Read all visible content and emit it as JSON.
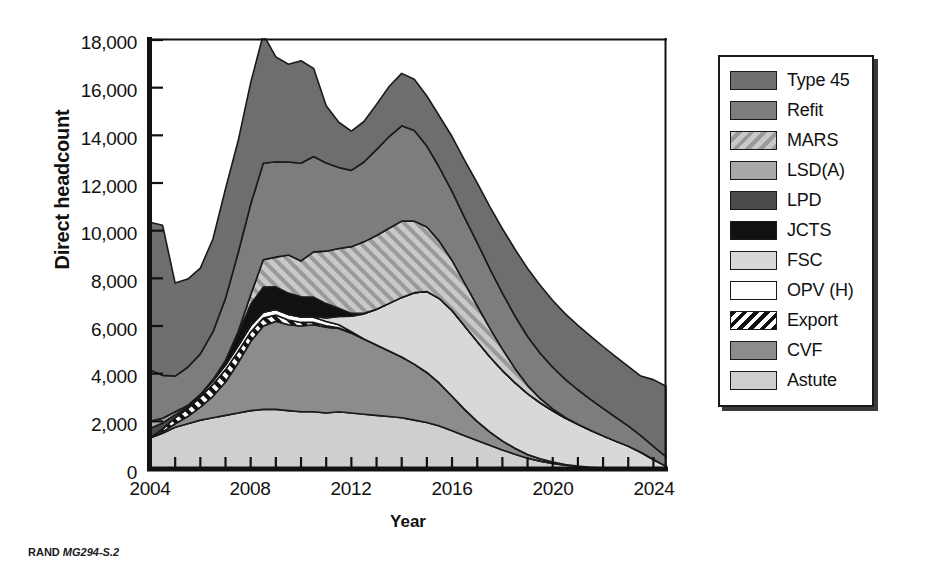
{
  "figure": {
    "caption_prefix": "RAND",
    "caption_code": "MG294-S.2"
  },
  "axes": {
    "y_title": "Direct headcount",
    "x_title": "Year",
    "y_ticks": [
      "0",
      "2,000",
      "4,000",
      "6,000",
      "8,000",
      "10,000",
      "12,000",
      "14,000",
      "16,000",
      "18,000"
    ],
    "x_ticks": [
      "2004",
      "2008",
      "2012",
      "2016",
      "2020",
      "2024"
    ]
  },
  "legend": {
    "items": [
      {
        "label": "Type 45",
        "fill": "#6e6e6e",
        "pattern": "solid"
      },
      {
        "label": "Refit",
        "fill": "#7d7d7d",
        "pattern": "solid"
      },
      {
        "label": "MARS",
        "fill": "#b4b4b4",
        "pattern": "hatch-grey"
      },
      {
        "label": "LSD(A)",
        "fill": "#a8a8a8",
        "pattern": "solid"
      },
      {
        "label": "LPD",
        "fill": "#4a4a4a",
        "pattern": "solid"
      },
      {
        "label": "JCTS",
        "fill": "#111111",
        "pattern": "solid"
      },
      {
        "label": "FSC",
        "fill": "#d8d8d8",
        "pattern": "solid"
      },
      {
        "label": "OPV (H)",
        "fill": "#ffffff",
        "pattern": "solid"
      },
      {
        "label": "Export",
        "fill": "#ffffff",
        "pattern": "hatch-black"
      },
      {
        "label": "CVF",
        "fill": "#8c8c8c",
        "pattern": "solid"
      },
      {
        "label": "Astute",
        "fill": "#cfcfcf",
        "pattern": "solid"
      }
    ]
  },
  "chart_data": {
    "type": "area",
    "stacked": true,
    "title": "",
    "xlabel": "Year",
    "ylabel": "Direct headcount",
    "xlim": [
      2004,
      2024.5
    ],
    "ylim": [
      0,
      18000
    ],
    "ytick_interval": 2000,
    "grid": false,
    "legend_position": "right-outside",
    "note": "Stacked area chart of UK naval shipbuilding direct headcount by programme, 2004-2024. Series are stacked bottom-to-top in the order listed below (Astute at the bottom, Type 45 at the top).",
    "x": [
      2004,
      2004.5,
      2005,
      2005.5,
      2006,
      2006.5,
      2007,
      2007.5,
      2008,
      2008.5,
      2009,
      2009.5,
      2010,
      2010.5,
      2011,
      2011.5,
      2012,
      2012.5,
      2013,
      2013.5,
      2014,
      2014.5,
      2015,
      2015.5,
      2016,
      2016.5,
      2017,
      2017.5,
      2018,
      2018.5,
      2019,
      2019.5,
      2020,
      2020.5,
      2021,
      2021.5,
      2022,
      2022.5,
      2023,
      2023.5,
      2024,
      2024.5
    ],
    "series": [
      {
        "name": "Astute",
        "fill": "#cfcfcf",
        "pattern": "solid",
        "values": [
          1300,
          1500,
          1750,
          1900,
          2050,
          2150,
          2250,
          2350,
          2450,
          2500,
          2500,
          2450,
          2400,
          2400,
          2350,
          2400,
          2350,
          2300,
          2250,
          2200,
          2150,
          2050,
          1950,
          1800,
          1600,
          1400,
          1200,
          1000,
          800,
          620,
          450,
          330,
          230,
          160,
          110,
          70,
          40,
          20,
          10,
          0,
          0,
          0
        ]
      },
      {
        "name": "CVF",
        "fill": "#8c8c8c",
        "pattern": "solid",
        "values": [
          0,
          60,
          150,
          300,
          550,
          900,
          1400,
          2100,
          2900,
          3500,
          3700,
          3600,
          3600,
          3650,
          3600,
          3500,
          3350,
          3150,
          2950,
          2750,
          2550,
          2350,
          2100,
          1800,
          1450,
          1100,
          800,
          560,
          380,
          250,
          160,
          100,
          60,
          30,
          15,
          5,
          0,
          0,
          0,
          0,
          0,
          0
        ]
      },
      {
        "name": "Export",
        "fill": "#ffffff",
        "pattern": "hatch-black",
        "values": [
          0,
          120,
          260,
          330,
          420,
          500,
          520,
          480,
          400,
          330,
          260,
          200,
          150,
          100,
          60,
          30,
          10,
          0,
          0,
          0,
          0,
          0,
          0,
          0,
          0,
          0,
          0,
          0,
          0,
          0,
          0,
          0,
          0,
          0,
          0,
          0,
          0,
          0,
          0,
          0,
          0,
          0
        ]
      },
      {
        "name": "OPV (H)",
        "fill": "#ffffff",
        "pattern": "solid",
        "values": [
          0,
          0,
          0,
          40,
          90,
          140,
          190,
          230,
          260,
          250,
          230,
          230,
          230,
          220,
          180,
          120,
          50,
          10,
          0,
          0,
          0,
          0,
          0,
          0,
          0,
          0,
          0,
          0,
          0,
          0,
          0,
          0,
          0,
          0,
          0,
          0,
          0,
          0,
          0,
          0,
          0,
          0
        ]
      },
      {
        "name": "FSC",
        "fill": "#d8d8d8",
        "pattern": "solid",
        "values": [
          0,
          0,
          0,
          0,
          0,
          0,
          0,
          0,
          0,
          0,
          0,
          0,
          0,
          40,
          150,
          350,
          650,
          1050,
          1500,
          2000,
          2500,
          3000,
          3400,
          3550,
          3600,
          3500,
          3350,
          3150,
          2950,
          2750,
          2550,
          2350,
          2150,
          1950,
          1750,
          1550,
          1350,
          1150,
          950,
          700,
          400,
          120
        ]
      },
      {
        "name": "JCTS",
        "fill": "#111111",
        "pattern": "solid",
        "values": [
          0,
          0,
          0,
          0,
          0,
          60,
          200,
          500,
          900,
          1050,
          950,
          900,
          850,
          800,
          600,
          350,
          120,
          20,
          0,
          0,
          0,
          0,
          0,
          0,
          0,
          0,
          0,
          0,
          0,
          0,
          0,
          0,
          0,
          0,
          0,
          0,
          0,
          0,
          0,
          0,
          0,
          0
        ]
      },
      {
        "name": "LPD",
        "fill": "#4a4a4a",
        "pattern": "solid",
        "values": [
          400,
          250,
          120,
          40,
          0,
          0,
          0,
          0,
          0,
          0,
          0,
          0,
          0,
          0,
          0,
          0,
          0,
          0,
          0,
          0,
          0,
          0,
          0,
          0,
          0,
          0,
          0,
          0,
          0,
          0,
          0,
          0,
          0,
          0,
          0,
          0,
          0,
          0,
          0,
          0,
          0,
          0
        ]
      },
      {
        "name": "LSD(A)",
        "fill": "#a8a8a8",
        "pattern": "solid",
        "values": [
          300,
          200,
          120,
          60,
          20,
          0,
          0,
          0,
          0,
          0,
          0,
          0,
          0,
          0,
          0,
          0,
          0,
          0,
          0,
          0,
          0,
          0,
          0,
          0,
          0,
          0,
          0,
          0,
          0,
          0,
          0,
          0,
          0,
          0,
          0,
          0,
          0,
          0,
          0,
          0,
          0,
          0
        ]
      },
      {
        "name": "MARS",
        "fill": "#b4b4b4",
        "pattern": "hatch-grey",
        "values": [
          0,
          0,
          0,
          0,
          0,
          0,
          0,
          100,
          400,
          1150,
          1250,
          1600,
          1500,
          1900,
          2200,
          2500,
          2800,
          3000,
          3100,
          3150,
          3200,
          3000,
          2700,
          2400,
          2100,
          1800,
          1500,
          1200,
          900,
          600,
          350,
          180,
          80,
          20,
          0,
          0,
          0,
          0,
          0,
          0,
          0,
          0
        ]
      },
      {
        "name": "Refit",
        "fill": "#7d7d7d",
        "pattern": "solid",
        "values": [
          2150,
          1800,
          1500,
          1600,
          1700,
          2000,
          2600,
          3300,
          3800,
          4050,
          4000,
          3900,
          4100,
          4000,
          3700,
          3400,
          3200,
          3350,
          3600,
          3850,
          4000,
          3800,
          3400,
          3100,
          2900,
          2750,
          2650,
          2500,
          2350,
          2200,
          2050,
          1900,
          1750,
          1600,
          1450,
          1300,
          1150,
          1000,
          850,
          700,
          550,
          400
        ]
      },
      {
        "name": "Type 45",
        "fill": "#6e6e6e",
        "pattern": "solid",
        "values": [
          6200,
          6300,
          3900,
          3700,
          3600,
          3900,
          4600,
          4700,
          5100,
          5400,
          4400,
          4100,
          4300,
          3700,
          2400,
          1900,
          1650,
          1700,
          1900,
          2100,
          2200,
          2150,
          2100,
          2150,
          2300,
          2400,
          2500,
          2600,
          2700,
          2800,
          2850,
          2850,
          2800,
          2750,
          2700,
          2650,
          2600,
          2550,
          2500,
          2500,
          2800,
          2950
        ]
      }
    ]
  }
}
